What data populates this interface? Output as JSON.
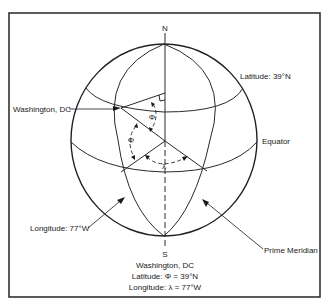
{
  "diagram": {
    "type": "globe-latitude-longitude",
    "labels": {
      "north": "N",
      "south": "S",
      "washington": "Washington, DC",
      "latitude_line": "Latitude: 39°N",
      "equator": "Equator",
      "longitude_line": "Longitude: 77°W",
      "prime_meridian": "Prime Meridian",
      "phi_upper": "Φ",
      "phi_lower": "Φ",
      "lambda": "λ"
    },
    "caption": {
      "line1": "Washington, DC",
      "line2": "Latitude: Φ = 39°N",
      "line3": "Longitude: λ = 77°W"
    },
    "colors": {
      "line": "#2a2a2a",
      "text": "#1a1a1a",
      "background": "#ffffff"
    }
  }
}
